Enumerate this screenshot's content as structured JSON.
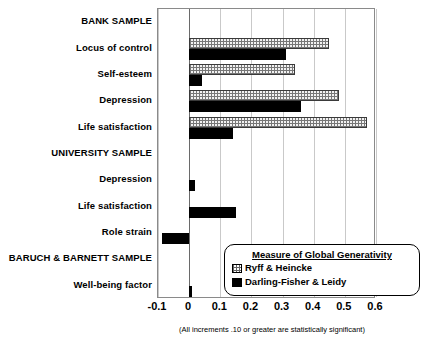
{
  "chart_data": {
    "type": "bar",
    "orientation": "horizontal",
    "title": "",
    "xlabel": "",
    "ylabel": "",
    "xlim": [
      -0.1,
      0.6
    ],
    "xticks": [
      -0.1,
      0,
      0.1,
      0.2,
      0.3,
      0.4,
      0.5,
      0.6
    ],
    "xtick_labels": [
      "-0.1",
      "0",
      "0.1",
      "0.2",
      "0.3",
      "0.4",
      "0.5",
      "0.6"
    ],
    "grid": true,
    "legend_position": "inside-lower-right",
    "legend_title": "Measure of Global Generativity",
    "note": "(All increments .10 or greater are statistically significant)",
    "categories": [
      "BANK SAMPLE",
      "Locus of control",
      "Self-esteem",
      "Depression",
      "Life satisfaction",
      "UNIVERSITY SAMPLE",
      "Depression",
      "Life satisfaction",
      "Role strain",
      "BARUCH & BARNETT SAMPLE",
      "Well-being factor"
    ],
    "category_is_header": [
      true,
      false,
      false,
      false,
      false,
      true,
      false,
      false,
      false,
      true,
      false
    ],
    "series": [
      {
        "name": "Ryff & Heincke",
        "swatch": "dotted-pattern",
        "values": [
          null,
          0.45,
          0.34,
          0.48,
          0.57,
          null,
          null,
          null,
          null,
          null,
          null
        ]
      },
      {
        "name": "Darling-Fisher & Leidy",
        "swatch": "solid-black",
        "values": [
          null,
          0.31,
          0.04,
          0.36,
          0.14,
          null,
          0.02,
          0.15,
          -0.086,
          null,
          0.01
        ]
      }
    ]
  },
  "colors": {
    "frame": "#8a8a8a",
    "gridline": "#c9c9c9",
    "zeroline": "#6a6a6a",
    "series_ryff_fill": "#f2f2f2",
    "series_darling_fill": "#000000",
    "background": "#ffffff"
  }
}
